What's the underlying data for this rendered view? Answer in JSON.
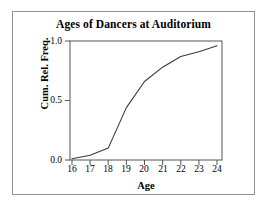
{
  "figure": {
    "title": "Ages of Dancers at Auditorium",
    "frame_color": "#8e8e8e",
    "background": "#ffffff",
    "line_color": "#3a3a3a"
  },
  "axes": {
    "xlabel": "Age",
    "ylabel": "Cum. Rel. Freq.",
    "xticks": [
      "16",
      "17",
      "18",
      "19",
      "20",
      "21",
      "22",
      "23",
      "24"
    ],
    "yticks": [
      "0.0",
      "0.5",
      "1.0"
    ]
  },
  "chart_data": {
    "type": "line",
    "title": "Ages of Dancers at Auditorium",
    "xlabel": "Age",
    "ylabel": "Cum. Rel. Freq.",
    "x": [
      16,
      17,
      18,
      19,
      20,
      21,
      22,
      23,
      24
    ],
    "values": [
      0.01,
      0.04,
      0.1,
      0.44,
      0.66,
      0.78,
      0.87,
      0.91,
      0.96
    ],
    "series": [
      {
        "name": "Cumulative Relative Frequency",
        "values": [
          0.01,
          0.04,
          0.1,
          0.44,
          0.66,
          0.78,
          0.87,
          0.91,
          0.96
        ]
      }
    ],
    "xlim": [
      15.7,
      24.4
    ],
    "ylim": [
      0.0,
      1.0
    ],
    "xtick_values": [
      16,
      17,
      18,
      19,
      20,
      21,
      22,
      23,
      24
    ],
    "ytick_values": [
      0.0,
      0.5,
      1.0
    ],
    "grid": false,
    "legend": false,
    "marker": "none",
    "line_color": "#3a3a3a"
  }
}
